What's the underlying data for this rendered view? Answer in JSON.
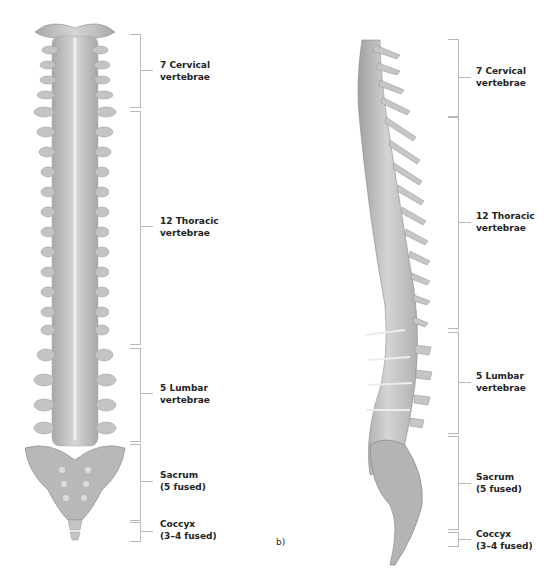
{
  "figure": {
    "panel_a": {
      "view": "posterior",
      "regions": [
        {
          "label_line1": "7 Cervical",
          "label_line2": "vertebrae"
        },
        {
          "label_line1": "12 Thoracic",
          "label_line2": "vertebrae"
        },
        {
          "label_line1": "5 Lumbar",
          "label_line2": "vertebrae"
        },
        {
          "label_line1": "Sacrum",
          "label_line2": "(5 fused)"
        },
        {
          "label_line1": "Coccyx",
          "label_line2": "(3–4 fused)"
        }
      ]
    },
    "panel_b": {
      "letter": "b)",
      "view": "lateral",
      "regions": [
        {
          "label_line1": "7 Cervical",
          "label_line2": "vertebrae"
        },
        {
          "label_line1": "12 Thoracic",
          "label_line2": "vertebrae"
        },
        {
          "label_line1": "5 Lumbar",
          "label_line2": "vertebrae"
        },
        {
          "label_line1": "Sacrum",
          "label_line2": "(5 fused)"
        },
        {
          "label_line1": "Coccyx",
          "label_line2": "(3–4 fused)"
        }
      ]
    },
    "colors": {
      "bone": "#c8c8c8",
      "bone_shadow": "#9a9a9a",
      "bracket": "#b8b8b8",
      "text": "#222222"
    }
  }
}
